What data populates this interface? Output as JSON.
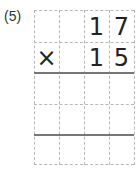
{
  "problem_label": "(5)",
  "rows": [
    [
      "",
      "",
      "1",
      "7"
    ],
    [
      "×",
      "",
      "1",
      "5"
    ],
    [
      "",
      "",
      "",
      ""
    ],
    [
      "",
      "",
      "",
      ""
    ],
    [
      "",
      "",
      "",
      ""
    ]
  ]
}
